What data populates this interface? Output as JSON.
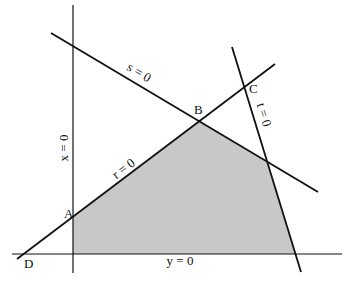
{
  "diagram": {
    "type": "linear-programming-feasible-region",
    "region_fill": "#c8c8c8",
    "line_color": "#111111",
    "lines": [
      {
        "id": "x",
        "label": "x = 0",
        "x1": 73,
        "y1": 5,
        "x2": 73,
        "y2": 273
      },
      {
        "id": "y",
        "label": "y = 0",
        "x1": 12,
        "y1": 254,
        "x2": 342,
        "y2": 254
      },
      {
        "id": "r",
        "label": "r = 0",
        "x1": 17,
        "y1": 259,
        "x2": 275,
        "y2": 64
      },
      {
        "id": "s",
        "label": "s = 0",
        "x1": 51,
        "y1": 33,
        "x2": 318,
        "y2": 192
      },
      {
        "id": "t",
        "label": "t = 0",
        "x1": 232,
        "y1": 47,
        "x2": 301,
        "y2": 272
      }
    ],
    "region_points": "73,254 73,217 199,121 267,163 295,254",
    "points": [
      {
        "name": "A",
        "x": 64,
        "y": 218
      },
      {
        "name": "B",
        "x": 194,
        "y": 114
      },
      {
        "name": "C",
        "x": 249,
        "y": 93
      },
      {
        "name": "D",
        "x": 24,
        "y": 268
      }
    ],
    "line_labels": [
      {
        "text": "s = 0",
        "x": 137,
        "y": 76,
        "rotate": 31
      },
      {
        "text": "t = 0",
        "x": 260,
        "y": 116,
        "rotate": 73
      },
      {
        "text": "x = 0",
        "x": 68,
        "y": 148,
        "rotate": -90
      },
      {
        "text": "r = 0",
        "x": 126,
        "y": 172,
        "rotate": -37
      },
      {
        "text": "y = 0",
        "x": 180,
        "y": 265,
        "rotate": 0
      }
    ]
  }
}
